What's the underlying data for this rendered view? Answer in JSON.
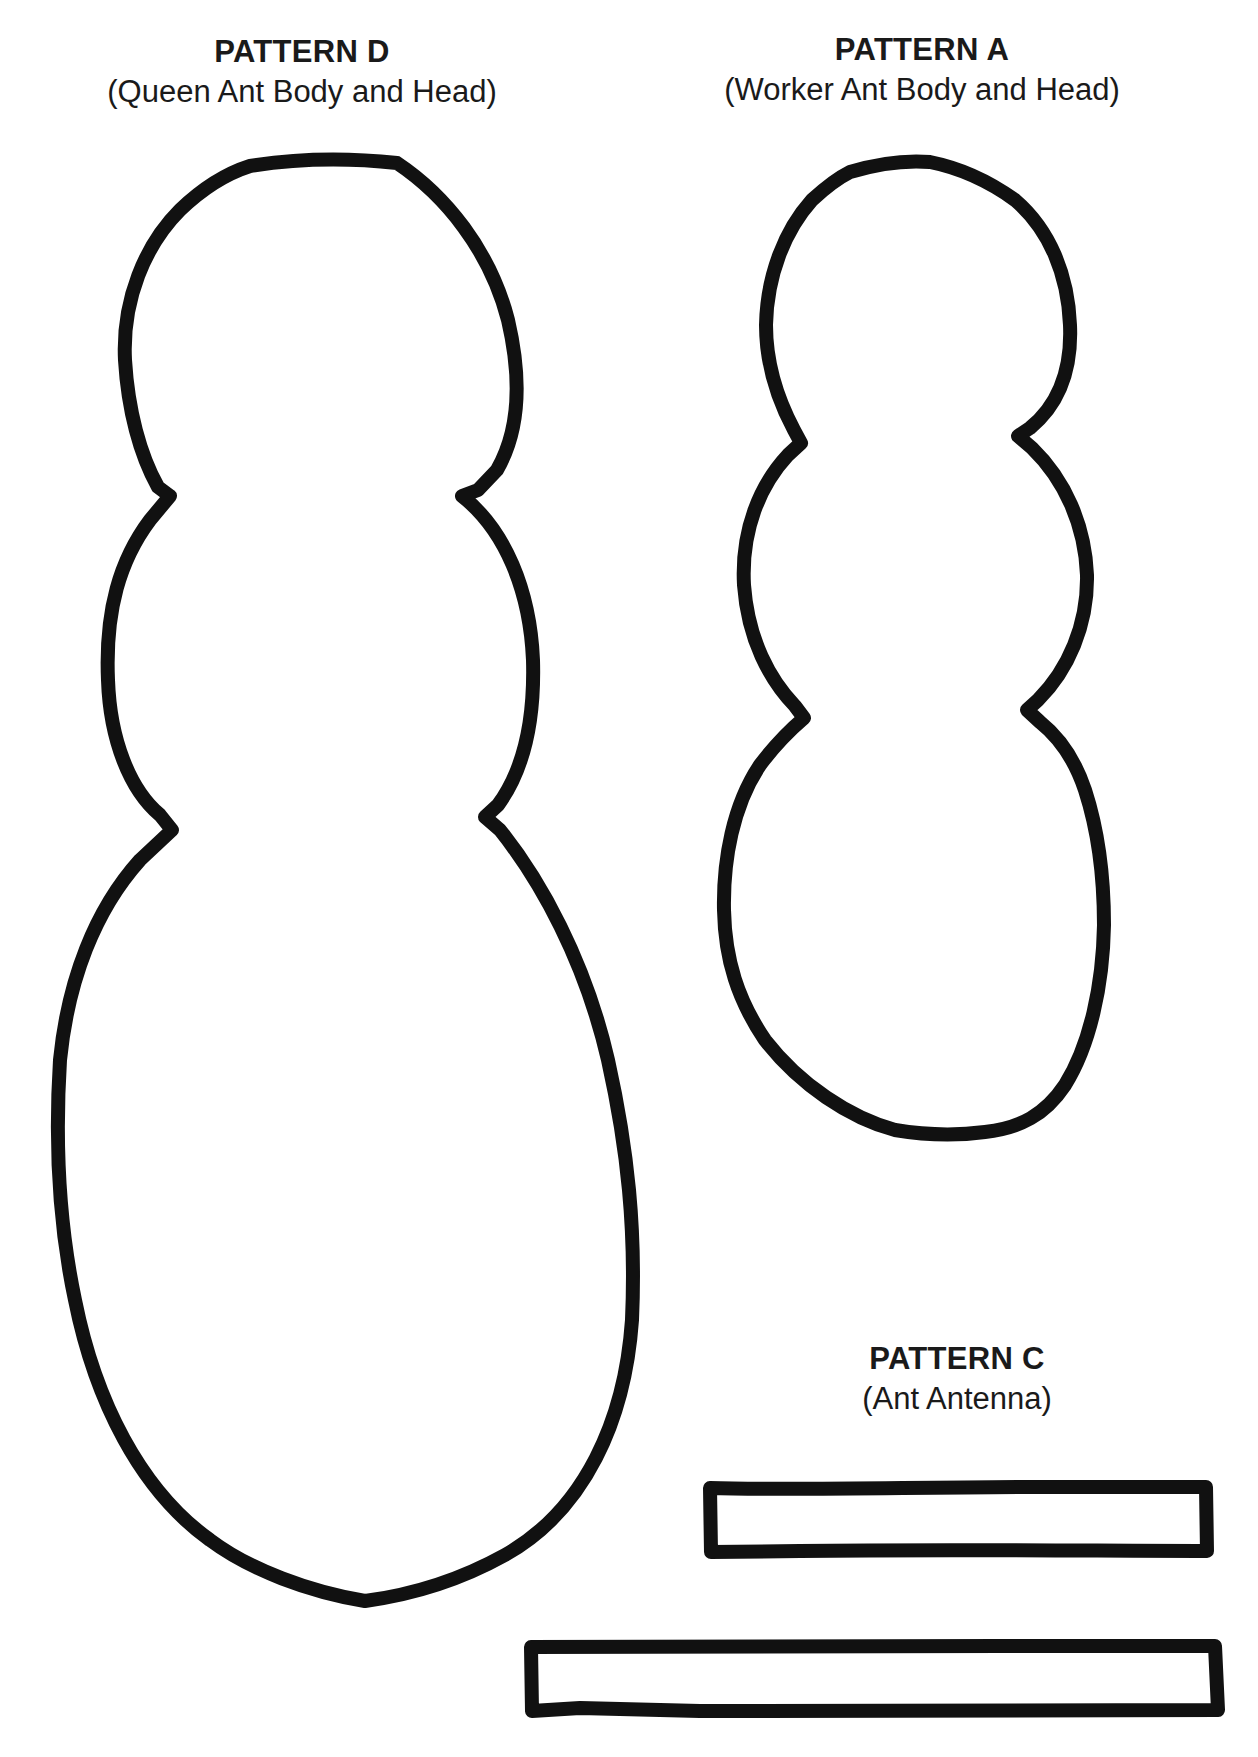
{
  "page": {
    "background_color": "#ffffff",
    "ink_color": "#111111"
  },
  "patterns": [
    {
      "id": "D",
      "title": "PATTERN D",
      "subtitle": "(Queen Ant Body and Head)",
      "shape": "three-segment ant body outline (head, thorax, pointed abdomen)"
    },
    {
      "id": "A",
      "title": "PATTERN A",
      "subtitle": "(Worker Ant Body and Head)",
      "shape": "three-segment ant body outline (head, thorax, rounded abdomen)"
    },
    {
      "id": "C",
      "title": "PATTERN C",
      "subtitle": "(Ant Antenna)",
      "shape": "two long narrow rectangles"
    }
  ]
}
